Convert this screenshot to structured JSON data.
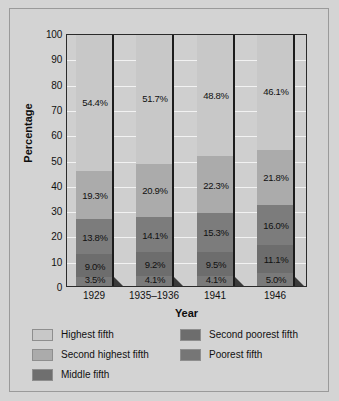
{
  "chart_data": {
    "type": "bar",
    "subtype": "stacked-bar-100",
    "title": "",
    "xlabel": "Year",
    "ylabel": "Percentage",
    "categories": [
      "1929",
      "1935–1936",
      "1941",
      "1946"
    ],
    "ylim": [
      0,
      100
    ],
    "yticks": [
      "100",
      "90",
      "80",
      "70",
      "60",
      "50",
      "40",
      "30",
      "20",
      "10",
      "0"
    ],
    "grid": true,
    "legend_position": "bottom",
    "series": [
      {
        "name": "Highest fifth",
        "color": "#c8c8c8",
        "values": [
          54.4,
          51.7,
          48.8,
          46.1
        ],
        "labels": [
          "54.4%",
          "51.7%",
          "48.8%",
          "46.1%"
        ]
      },
      {
        "name": "Second highest fifth",
        "color": "#ababab",
        "values": [
          19.3,
          20.9,
          22.3,
          21.8
        ],
        "labels": [
          "19.3%",
          "20.9%",
          "22.3%",
          "21.8%"
        ]
      },
      {
        "name": "Middle fifth",
        "color": "#7c7c7c",
        "values": [
          13.8,
          14.1,
          15.3,
          16.0
        ],
        "labels": [
          "13.8%",
          "14.1%",
          "15.3%",
          "16.0%"
        ]
      },
      {
        "name": "Second poorest fifth",
        "color": "#6d6d6d",
        "values": [
          9.0,
          9.2,
          9.5,
          11.1
        ],
        "labels": [
          "9.0%",
          "9.2%",
          "9.5%",
          "11.1%"
        ]
      },
      {
        "name": "Poorest fifth",
        "color": "#7a7a7a",
        "values": [
          3.5,
          4.1,
          4.1,
          5.0
        ],
        "labels": [
          "3.5%",
          "4.1%",
          "4.1%",
          "5.0%"
        ]
      }
    ]
  },
  "legend": {
    "left_column": [
      {
        "label": "Highest fifth",
        "color": "#c8c8c8"
      },
      {
        "label": "Second highest fifth",
        "color": "#ababab"
      },
      {
        "label": "Middle fifth",
        "color": "#6f6f6f"
      }
    ],
    "right_column": [
      {
        "label": "Second poorest fifth",
        "color": "#6d6d6d"
      },
      {
        "label": "Poorest fifth",
        "color": "#767676"
      }
    ]
  }
}
